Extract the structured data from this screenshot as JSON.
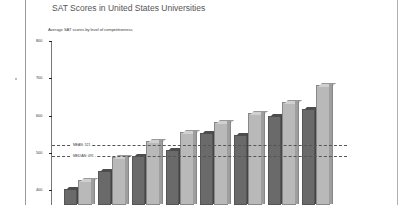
{
  "chart_data": {
    "type": "bar",
    "title": "SAT Scores in United States Universities",
    "subtitle": "Average SAT scores by level of competitiveness",
    "xlabel": "",
    "ylabel": "",
    "ylim": [
      380,
      800
    ],
    "yticks": [
      800,
      700,
      600,
      500,
      400
    ],
    "grid": false,
    "legend": null,
    "categories": [
      "1",
      "2",
      "3",
      "4",
      "5",
      "6",
      "7",
      "8"
    ],
    "series": [
      {
        "name": "Series A (dark)",
        "color": "#6a6a6a",
        "values": [
          403,
          451,
          491,
          507,
          553,
          548,
          599,
          617
        ]
      },
      {
        "name": "Series B (light)",
        "color": "#b9b9b9",
        "values": [
          427,
          489,
          532,
          556,
          583,
          607,
          636,
          682
        ]
      }
    ],
    "reference_lines": [
      {
        "label": "MEAN: 521",
        "value": 521,
        "style": "dashed"
      },
      {
        "label": "MEDIAN: 491",
        "value": 491,
        "style": "dashed"
      }
    ]
  },
  "labels": {
    "title": "SAT Scores in United States Universities",
    "subtitle": "Average SAT scores by level of competitiveness",
    "ticks": [
      "800",
      "700",
      "600",
      "500",
      "400"
    ],
    "ref1": "MEAN: 521",
    "ref2": "MEDIAN: 491"
  }
}
